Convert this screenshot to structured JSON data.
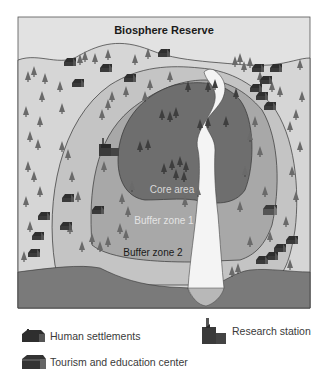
{
  "diagram": {
    "title": "Biosphere Reserve",
    "zones": [
      {
        "id": "core",
        "label": "Core area",
        "color": "#6e6e6e",
        "label_color": "#d8d8d8"
      },
      {
        "id": "buffer1",
        "label": "Buffer zone 1",
        "color": "#a8a8a8",
        "label_color": "#e4e4e4"
      },
      {
        "id": "buffer2",
        "label": "Buffer zone 2",
        "color": "#c4c4c4",
        "label_color": "#1a1a1a"
      }
    ],
    "colors": {
      "sky": "#e2e2e2",
      "outer_land": "#d6d6d6",
      "water": "#7a7a7a",
      "river": "#f4f4f4",
      "frame": "#555555"
    }
  },
  "legend": {
    "items": [
      {
        "icon": "house-icon",
        "label": "Human settlements"
      },
      {
        "icon": "research-station-icon",
        "label": "Research station"
      },
      {
        "icon": "tourism-center-icon",
        "label": "Tourism and education center"
      }
    ]
  }
}
